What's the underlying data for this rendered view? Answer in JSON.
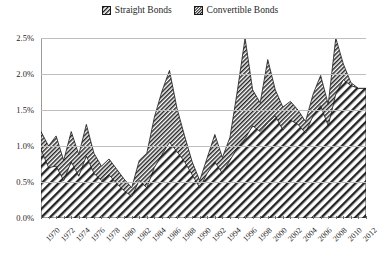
{
  "legend": {
    "position": "top-center",
    "entries": [
      {
        "label": "Straight Bonds",
        "pattern": "coarse-diagonal-hatch",
        "marker": "square-swatch"
      },
      {
        "label": "Convertible Bonds",
        "pattern": "fine-diagonal-hatch",
        "marker": "square-swatch"
      }
    ]
  },
  "colors": {
    "ink": "#1a1a1a",
    "gridline": "#bfbfbf",
    "axis": "#6e6e6e",
    "background": "#ffffff"
  },
  "chart_data": {
    "type": "area",
    "stacked": true,
    "title": "",
    "xlabel": "",
    "ylabel": "",
    "ylim": [
      0,
      2.5
    ],
    "ytick_labels": [
      "0.0%",
      "0.5%",
      "1.0%",
      "1.5%",
      "2.0%",
      "2.5%"
    ],
    "ytick_values": [
      0,
      0.5,
      1.0,
      1.5,
      2.0,
      2.5
    ],
    "grid": true,
    "xlim": [
      1970,
      2013
    ],
    "xtick_labels": [
      "1970",
      "1972",
      "1974",
      "1976",
      "1978",
      "1980",
      "1982",
      "1984",
      "1986",
      "1988",
      "1990",
      "1992",
      "1994",
      "1996",
      "1998",
      "2000",
      "2002",
      "2004",
      "2006",
      "2008",
      "2010",
      "2012"
    ],
    "x": [
      1970,
      1971,
      1972,
      1973,
      1974,
      1975,
      1976,
      1977,
      1978,
      1979,
      1980,
      1981,
      1982,
      1983,
      1984,
      1985,
      1986,
      1987,
      1988,
      1989,
      1990,
      1991,
      1992,
      1993,
      1994,
      1995,
      1996,
      1997,
      1998,
      1999,
      2000,
      2001,
      2002,
      2003,
      2004,
      2005,
      2006,
      2007,
      2008,
      2009,
      2010,
      2011,
      2012,
      2013
    ],
    "series": [
      {
        "name": "Straight Bonds",
        "pattern": "coarse-diagonal-hatch",
        "values": [
          0.95,
          0.7,
          0.72,
          0.52,
          0.78,
          0.58,
          0.86,
          0.62,
          0.52,
          0.6,
          0.48,
          0.38,
          0.3,
          0.52,
          0.42,
          0.7,
          0.88,
          1.05,
          0.92,
          0.78,
          0.6,
          0.42,
          0.62,
          0.78,
          0.62,
          0.8,
          0.98,
          1.1,
          1.28,
          1.2,
          1.32,
          1.42,
          1.22,
          1.36,
          1.3,
          1.18,
          1.42,
          1.56,
          1.28,
          1.72,
          1.92,
          1.84,
          1.8,
          1.8
        ]
      },
      {
        "name": "Convertible Bonds",
        "pattern": "fine-diagonal-hatch",
        "values": [
          0.25,
          0.3,
          0.42,
          0.28,
          0.42,
          0.3,
          0.44,
          0.28,
          0.2,
          0.22,
          0.2,
          0.16,
          0.12,
          0.28,
          0.48,
          0.7,
          0.88,
          1.0,
          0.6,
          0.36,
          0.18,
          0.1,
          0.22,
          0.38,
          0.22,
          0.32,
          0.8,
          1.4,
          0.5,
          0.4,
          0.88,
          0.36,
          0.32,
          0.26,
          0.2,
          0.16,
          0.3,
          0.42,
          0.3,
          0.78,
          0.22,
          0.04,
          0.0,
          0.0
        ]
      }
    ],
    "totals": [
      1.2,
      1.0,
      1.14,
      0.8,
      1.2,
      0.88,
      1.3,
      0.9,
      0.72,
      0.82,
      0.68,
      0.54,
      0.42,
      0.8,
      0.9,
      1.4,
      1.76,
      2.05,
      1.52,
      1.14,
      0.78,
      0.52,
      0.84,
      1.16,
      0.84,
      1.12,
      1.78,
      2.5,
      1.78,
      1.6,
      2.2,
      1.78,
      1.54,
      1.62,
      1.5,
      1.34,
      1.72,
      1.98,
      1.58,
      2.5,
      2.14,
      1.88,
      1.8,
      1.8
    ],
    "annotations": []
  }
}
